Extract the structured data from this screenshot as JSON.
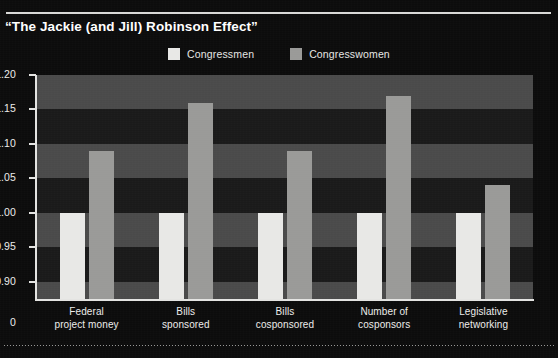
{
  "header": {
    "title": "“The Jackie (and Jill) Robinson Effect”"
  },
  "colors": {
    "background": "#0c0c0c",
    "plot_background": "#151515",
    "band_light": "#4a4a4a",
    "band_dark": "#1a1a1a",
    "congressmen": "#e8e8e6",
    "congresswomen": "#9a9a98",
    "axis": "#e4e4e2",
    "text": "#ededeb"
  },
  "chart_data": {
    "type": "bar",
    "title": "“The Jackie (and Jill) Robinson Effect”",
    "xlabel": "",
    "ylabel": "",
    "ylim": [
      0.875,
      1.2
    ],
    "grid": true,
    "grid_style": "alternating horizontal bands",
    "legend_position": "top-center",
    "axis_break": true,
    "categories": [
      "Federal project money",
      "Bills sponsored",
      "Bills cosponsored",
      "Number of cosponsors",
      "Legislative networking"
    ],
    "category_lines": [
      [
        "Federal",
        "project money"
      ],
      [
        "Bills",
        "sponsored"
      ],
      [
        "Bills",
        "cosponsored"
      ],
      [
        "Number of",
        "cosponsors"
      ],
      [
        "Legislative",
        "networking"
      ]
    ],
    "series": [
      {
        "name": "Congressmen",
        "color": "#e8e8e6",
        "values": [
          1.0,
          1.0,
          1.0,
          1.0,
          1.0
        ]
      },
      {
        "name": "Congresswomen",
        "color": "#9a9a98",
        "values": [
          1.09,
          1.16,
          1.09,
          1.17,
          1.04
        ]
      }
    ],
    "yticks": [
      {
        "value": 1.2,
        "label": "1.20"
      },
      {
        "value": 1.15,
        "label": "1.15"
      },
      {
        "value": 1.1,
        "label": "1.10"
      },
      {
        "value": 1.05,
        "label": "1.05"
      },
      {
        "value": 1.0,
        "label": "1.00"
      },
      {
        "value": 0.95,
        "label": "0.95"
      },
      {
        "value": 0.9,
        "label": "0.90"
      },
      {
        "value": 0.0,
        "label": "0"
      }
    ]
  }
}
